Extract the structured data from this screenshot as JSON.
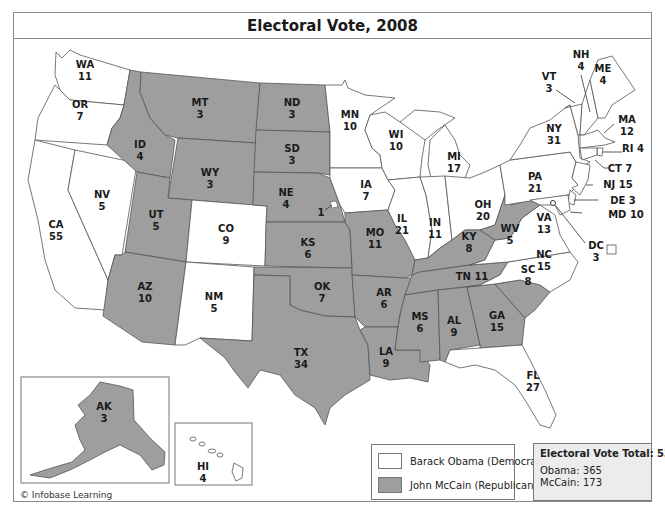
{
  "title": "Electoral Vote, 2008",
  "colors": {
    "democrat": "#ffffff",
    "republican": "#9e9e9e",
    "border": "#555555",
    "totals_bg": "#ececec"
  },
  "legend": {
    "items": [
      {
        "label": "Barack Obama (Democrat)",
        "party": "democrat"
      },
      {
        "label": "John McCain (Republican)",
        "party": "republican"
      }
    ]
  },
  "totals": {
    "heading": "Electoral Vote Total: 538",
    "lines": [
      "Obama: 365",
      "McCain: 173"
    ]
  },
  "copyright": "© Infobase Learning",
  "states": {
    "WA": {
      "abbr": "WA",
      "votes": "11",
      "winner": "democrat"
    },
    "OR": {
      "abbr": "OR",
      "votes": "7",
      "winner": "democrat"
    },
    "CA": {
      "abbr": "CA",
      "votes": "55",
      "winner": "democrat"
    },
    "NV": {
      "abbr": "NV",
      "votes": "5",
      "winner": "democrat"
    },
    "ID": {
      "abbr": "ID",
      "votes": "4",
      "winner": "republican"
    },
    "MT": {
      "abbr": "MT",
      "votes": "3",
      "winner": "republican"
    },
    "WY": {
      "abbr": "WY",
      "votes": "3",
      "winner": "republican"
    },
    "UT": {
      "abbr": "UT",
      "votes": "5",
      "winner": "republican"
    },
    "AZ": {
      "abbr": "AZ",
      "votes": "10",
      "winner": "republican"
    },
    "CO": {
      "abbr": "CO",
      "votes": "9",
      "winner": "democrat"
    },
    "NM": {
      "abbr": "NM",
      "votes": "5",
      "winner": "democrat"
    },
    "ND": {
      "abbr": "ND",
      "votes": "3",
      "winner": "republican"
    },
    "SD": {
      "abbr": "SD",
      "votes": "3",
      "winner": "republican"
    },
    "NE": {
      "abbr": "NE",
      "votes": "4",
      "winner": "republican",
      "split_note": "1"
    },
    "KS": {
      "abbr": "KS",
      "votes": "6",
      "winner": "republican"
    },
    "OK": {
      "abbr": "OK",
      "votes": "7",
      "winner": "republican"
    },
    "TX": {
      "abbr": "TX",
      "votes": "34",
      "winner": "republican"
    },
    "MN": {
      "abbr": "MN",
      "votes": "10",
      "winner": "democrat"
    },
    "IA": {
      "abbr": "IA",
      "votes": "7",
      "winner": "democrat"
    },
    "MO": {
      "abbr": "MO",
      "votes": "11",
      "winner": "republican"
    },
    "AR": {
      "abbr": "AR",
      "votes": "6",
      "winner": "republican"
    },
    "LA": {
      "abbr": "LA",
      "votes": "9",
      "winner": "republican"
    },
    "WI": {
      "abbr": "WI",
      "votes": "10",
      "winner": "democrat"
    },
    "IL": {
      "abbr": "IL",
      "votes": "21",
      "winner": "democrat"
    },
    "MI": {
      "abbr": "MI",
      "votes": "17",
      "winner": "democrat"
    },
    "IN": {
      "abbr": "IN",
      "votes": "11",
      "winner": "democrat"
    },
    "OH": {
      "abbr": "OH",
      "votes": "20",
      "winner": "democrat"
    },
    "KY": {
      "abbr": "KY",
      "votes": "8",
      "winner": "republican"
    },
    "TN": {
      "abbr": "TN",
      "votes": "11",
      "winner": "republican"
    },
    "MS": {
      "abbr": "MS",
      "votes": "6",
      "winner": "republican"
    },
    "AL": {
      "abbr": "AL",
      "votes": "9",
      "winner": "republican"
    },
    "GA": {
      "abbr": "GA",
      "votes": "15",
      "winner": "republican"
    },
    "FL": {
      "abbr": "FL",
      "votes": "27",
      "winner": "democrat"
    },
    "SC": {
      "abbr": "SC",
      "votes": "8",
      "winner": "republican"
    },
    "NC": {
      "abbr": "NC",
      "votes": "15",
      "winner": "democrat"
    },
    "VA": {
      "abbr": "VA",
      "votes": "13",
      "winner": "democrat"
    },
    "WV": {
      "abbr": "WV",
      "votes": "5",
      "winner": "republican"
    },
    "PA": {
      "abbr": "PA",
      "votes": "21",
      "winner": "democrat"
    },
    "NY": {
      "abbr": "NY",
      "votes": "31",
      "winner": "democrat"
    },
    "VT": {
      "abbr": "VT",
      "votes": "3",
      "winner": "democrat"
    },
    "NH": {
      "abbr": "NH",
      "votes": "4",
      "winner": "democrat"
    },
    "ME": {
      "abbr": "ME",
      "votes": "4",
      "winner": "democrat"
    },
    "MA": {
      "abbr": "MA",
      "votes": "12",
      "winner": "democrat"
    },
    "RI": {
      "abbr": "RI",
      "votes": "4",
      "winner": "democrat"
    },
    "CT": {
      "abbr": "CT",
      "votes": "7",
      "winner": "democrat"
    },
    "NJ": {
      "abbr": "NJ",
      "votes": "15",
      "winner": "democrat"
    },
    "DE": {
      "abbr": "DE",
      "votes": "3",
      "winner": "democrat"
    },
    "MD": {
      "abbr": "MD",
      "votes": "10",
      "winner": "democrat"
    },
    "DC": {
      "abbr": "DC",
      "votes": "3",
      "winner": "democrat"
    },
    "AK": {
      "abbr": "AK",
      "votes": "3",
      "winner": "republican"
    },
    "HI": {
      "abbr": "HI",
      "votes": "4",
      "winner": "democrat"
    }
  },
  "labels": {
    "RI": "RI 4",
    "CT": "CT 7",
    "NJ": "NJ 15",
    "DE": "DE 3",
    "MD": "MD 10",
    "TN": "TN 11"
  }
}
